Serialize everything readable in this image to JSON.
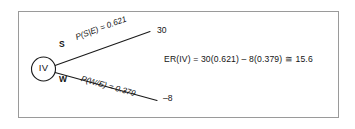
{
  "diagram": {
    "type": "decision-tree",
    "title_visible": false,
    "node": {
      "label": "IV",
      "shape": "circle",
      "meaning": "chance-node"
    },
    "branches": [
      {
        "id": "upper",
        "label": "S",
        "probability_text": "P(S|E) = 0.621",
        "probability_value": 0.621,
        "payoff": "30",
        "payoff_value": 30
      },
      {
        "id": "lower",
        "label": "W",
        "probability_text": "P(W/E) = 0.379",
        "probability_value": 0.379,
        "payoff": "–8",
        "payoff_value": -8
      }
    ],
    "equation": "ER(IV) = 30(0.621) – 8(0.379) ≅ 15.6",
    "expected_value": 15.6,
    "colors": {
      "line": "#1a1a1a",
      "frame": "#9a9a9a",
      "text": "#141414",
      "background": "#ffffff"
    }
  }
}
